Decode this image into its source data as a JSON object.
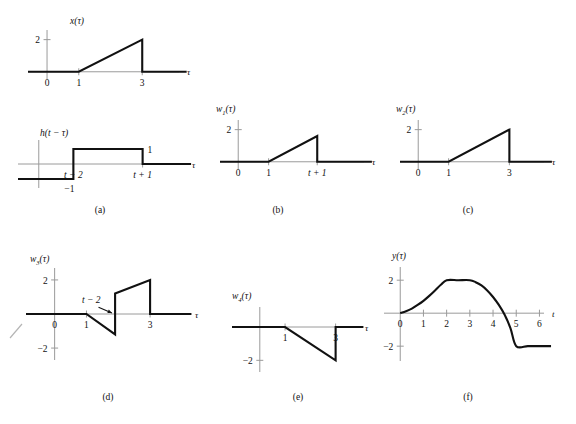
{
  "figure": {
    "type": "signal-convolution-figure",
    "background": "#ffffff",
    "ink": "#111111",
    "axis_color": "#9a9a9a"
  },
  "panels": [
    {
      "id": "a-top",
      "caption": "",
      "ylabel": "x(τ)",
      "ylabel_base": "x",
      "ylabel_arg": "(τ)",
      "xlabel": "τ",
      "yticks": [
        {
          "value": 2,
          "label": "2"
        }
      ],
      "xticks": [
        {
          "value": 0,
          "label": "0"
        },
        {
          "value": 1,
          "label": "1"
        },
        {
          "value": 3,
          "label": "3"
        }
      ],
      "xlim": [
        -0.6,
        4.6
      ],
      "ylim": [
        -0.45,
        2.6
      ],
      "description": "Ramp rising from 0 at tau=1 to 2 at tau=3, then dropping to 0."
    },
    {
      "id": "a-bottom",
      "caption": "(a)",
      "ylabel": "h(t − τ)",
      "ylabel_base": "h",
      "ylabel_arg": "(t − τ)",
      "xlabel": "τ",
      "level_labels": [
        {
          "value": 1,
          "label": "1"
        },
        {
          "value": -1,
          "label": "−1"
        }
      ],
      "xticks": [
        {
          "value": 1,
          "label": "t − 2"
        },
        {
          "value": 3,
          "label": "t + 1"
        }
      ],
      "xlim": [
        -0.6,
        4.6
      ],
      "ylim": [
        -1.6,
        1.6
      ],
      "description": "Value −1 for tau < t−2, value +1 between t−2 and t+1, 0 after."
    },
    {
      "id": "b",
      "caption": "(b)",
      "ylabel_base": "w",
      "ylabel_sub": "1",
      "ylabel_arg": "(τ)",
      "xlabel": "τ",
      "yticks": [
        {
          "value": 2,
          "label": "2"
        }
      ],
      "xticks": [
        {
          "value": 0,
          "label": "0"
        },
        {
          "value": 1,
          "label": "1"
        },
        {
          "value": 2.6,
          "label": "t + 1"
        }
      ],
      "xlim": [
        -0.6,
        4.6
      ],
      "ylim": [
        -0.45,
        2.6
      ],
      "description": "Ramp rising from 0 at tau=1 to about 1.6 at tau=t+1, then dropping to 0."
    },
    {
      "id": "c",
      "caption": "(c)",
      "ylabel_base": "w",
      "ylabel_sub": "2",
      "ylabel_arg": "(τ)",
      "xlabel": "τ",
      "yticks": [
        {
          "value": 2,
          "label": "2"
        }
      ],
      "xticks": [
        {
          "value": 0,
          "label": "0"
        },
        {
          "value": 1,
          "label": "1"
        },
        {
          "value": 3,
          "label": "3"
        }
      ],
      "xlim": [
        -0.6,
        4.6
      ],
      "ylim": [
        -0.45,
        2.6
      ],
      "description": "Ramp rising from 0 at tau=1 to 2 at tau=3, then dropping to 0."
    },
    {
      "id": "d",
      "caption": "(d)",
      "ylabel_base": "w",
      "ylabel_sub": "3",
      "ylabel_arg": "(τ)",
      "xlabel": "τ",
      "yticks": [
        {
          "value": 2,
          "label": "2"
        },
        {
          "value": -2,
          "label": "−2"
        }
      ],
      "xticks": [
        {
          "value": 0,
          "label": "0"
        },
        {
          "value": 1,
          "label": "1"
        },
        {
          "value": 3,
          "label": "3"
        }
      ],
      "annotation": {
        "text": "t − 2",
        "points_to": 1.9
      },
      "xlim": [
        -0.9,
        4.6
      ],
      "ylim": [
        -2.7,
        2.7
      ],
      "description": "Falls from 0 at tau=1 to about −1.2 at t−2, jumps up to about +1.2, rises to 2 at tau=3, then drops to 0."
    },
    {
      "id": "e",
      "caption": "(e)",
      "ylabel_base": "w",
      "ylabel_sub": "4",
      "ylabel_arg": "(τ)",
      "xlabel": "τ",
      "yticks": [
        {
          "value": -2,
          "label": "−2"
        }
      ],
      "xticks": [
        {
          "value": 1,
          "label": "1"
        },
        {
          "value": 3,
          "label": "3"
        }
      ],
      "xlim": [
        -1.1,
        4.4
      ],
      "ylim": [
        -2.7,
        1.2
      ],
      "description": "Zero until tau=1, falls linearly to −2 at tau=3, then jumps back to 0."
    },
    {
      "id": "f",
      "caption": "(f)",
      "ylabel": "y(τ)",
      "ylabel_base": "y",
      "ylabel_arg": "(τ)",
      "xlabel": "t",
      "yticks": [
        {
          "value": 2,
          "label": "2"
        },
        {
          "value": -2,
          "label": "−2"
        }
      ],
      "xticks": [
        {
          "value": 0,
          "label": "0"
        },
        {
          "value": 1,
          "label": "1"
        },
        {
          "value": 2,
          "label": "2"
        },
        {
          "value": 3,
          "label": "3"
        },
        {
          "value": 4,
          "label": "4"
        },
        {
          "value": 5,
          "label": "5"
        },
        {
          "value": 6,
          "label": "6"
        }
      ],
      "xlim": [
        -0.7,
        6.8
      ],
      "ylim": [
        -2.9,
        2.8
      ],
      "description": "Convex rise from 0 at t=0 to 2 at t=2, flat at 2 until t=3, concave fall crossing zero near t=4.55, reaching −2 at t=5, flat afterwards."
    }
  ],
  "chart_data": {
    "type": "line",
    "title": "",
    "panels": [
      {
        "name": "a-top",
        "label": "x(τ)",
        "xlabel": "τ",
        "ylabel": "x(τ)",
        "xlim": [
          -0.6,
          4.6
        ],
        "ylim": [
          -0.45,
          2.6
        ],
        "x": [
          -0.6,
          1,
          3,
          3,
          4.4
        ],
        "y": [
          0,
          0,
          2,
          0,
          0
        ]
      },
      {
        "name": "a-bottom",
        "label": "h(t − τ)",
        "xlabel": "τ",
        "ylabel": "h(t − τ)",
        "xlim": [
          -0.6,
          4.6
        ],
        "ylim": [
          -1.6,
          1.6
        ],
        "x": [
          -0.6,
          1,
          1,
          3,
          3,
          4.4
        ],
        "y": [
          -1,
          -1,
          1,
          1,
          0,
          0
        ]
      },
      {
        "name": "b",
        "label": "w1(τ)",
        "xlabel": "τ",
        "ylabel": "w1(τ)",
        "xlim": [
          -0.6,
          4.6
        ],
        "ylim": [
          -0.45,
          2.6
        ],
        "x": [
          -0.6,
          1,
          2.6,
          2.6,
          4.4
        ],
        "y": [
          0,
          0,
          1.6,
          0,
          0
        ]
      },
      {
        "name": "c",
        "label": "w2(τ)",
        "xlabel": "τ",
        "ylabel": "w2(τ)",
        "xlim": [
          -0.6,
          4.6
        ],
        "ylim": [
          -0.45,
          2.6
        ],
        "x": [
          -0.6,
          1,
          3,
          3,
          4.4
        ],
        "y": [
          0,
          0,
          2,
          0,
          0
        ]
      },
      {
        "name": "d",
        "label": "w3(τ)",
        "xlabel": "τ",
        "ylabel": "w3(τ)",
        "xlim": [
          -0.9,
          4.6
        ],
        "ylim": [
          -2.7,
          2.7
        ],
        "x": [
          -0.9,
          1,
          1.9,
          1.9,
          3,
          3,
          4.3
        ],
        "y": [
          0,
          0,
          -1.2,
          1.2,
          2,
          0,
          0
        ]
      },
      {
        "name": "e",
        "label": "w4(τ)",
        "xlabel": "τ",
        "ylabel": "w4(τ)",
        "xlim": [
          -1.1,
          4.4
        ],
        "ylim": [
          -2.7,
          1.2
        ],
        "x": [
          -1.1,
          1,
          3,
          3,
          4.1
        ],
        "y": [
          0,
          0,
          -2,
          0,
          0
        ]
      },
      {
        "name": "f",
        "label": "y(τ)",
        "xlabel": "t",
        "ylabel": "y(τ)",
        "xlim": [
          -0.7,
          6.8
        ],
        "ylim": [
          -2.9,
          2.8
        ],
        "x": [
          0,
          0.25,
          0.5,
          0.75,
          1,
          1.25,
          1.5,
          1.75,
          2,
          2.5,
          3,
          3.25,
          3.5,
          3.75,
          4,
          4.25,
          4.5,
          4.75,
          5,
          5.5,
          6,
          6.5
        ],
        "y": [
          0,
          0.12,
          0.28,
          0.5,
          0.75,
          1.05,
          1.38,
          1.72,
          2,
          2,
          2,
          1.88,
          1.68,
          1.38,
          0.98,
          0.5,
          -0.1,
          -0.9,
          -2,
          -2,
          -2,
          -2
        ]
      }
    ]
  }
}
